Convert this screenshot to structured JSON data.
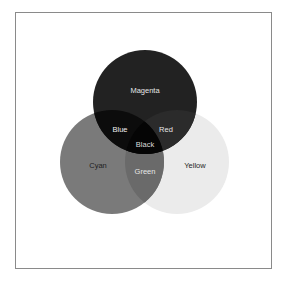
{
  "diagram": {
    "type": "venn",
    "sets": [
      {
        "name": "Magenta",
        "label": "Magenta",
        "fill": "#222222",
        "text_color": "#e6e6e6"
      },
      {
        "name": "Cyan",
        "label": "Cyan",
        "fill": "#7a7a7a",
        "text_color": "#1e1e1e"
      },
      {
        "name": "Yellow",
        "label": "Yellow",
        "fill": "#ebebeb",
        "text_color": "#1e1e1e"
      }
    ],
    "overlaps": {
      "magenta_cyan": {
        "label": "Blue",
        "fill": "#0c0c0c",
        "text_color": "#f0f0f0"
      },
      "magenta_yellow": {
        "label": "Red",
        "fill": "#2b2b2b",
        "text_color": "#e6e6e6"
      },
      "cyan_yellow": {
        "label": "Green",
        "fill": "#6a6a6a",
        "text_color": "#e6e6e6"
      },
      "all": {
        "label": "Black",
        "fill": "#050505",
        "text_color": "#dcdcdc"
      }
    },
    "frame_color": "#8a8a8a"
  }
}
